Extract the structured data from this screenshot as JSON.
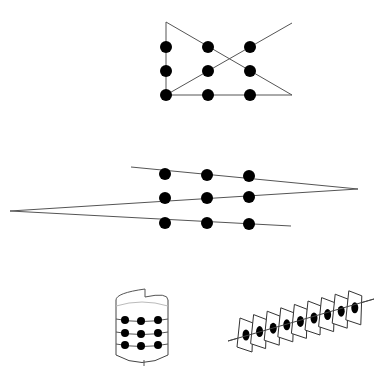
{
  "caption": "",
  "colors": {
    "dot": "#000000",
    "line": "#555555",
    "background": "#ffffff"
  },
  "figures": [
    {
      "id": "nine-dots-four-lines",
      "dot_radius": 6,
      "dots": [
        [
          166,
          47
        ],
        [
          208,
          47
        ],
        [
          250,
          47
        ],
        [
          166,
          71
        ],
        [
          208,
          71
        ],
        [
          250,
          71
        ],
        [
          166,
          95
        ],
        [
          208,
          95
        ],
        [
          250,
          95
        ]
      ],
      "polyline": [
        [
          292,
          23
        ],
        [
          166,
          95
        ],
        [
          166,
          22
        ],
        [
          292,
          95
        ],
        [
          166,
          95
        ]
      ]
    },
    {
      "id": "nine-dots-three-lines-zigzag",
      "dot_radius": 6,
      "dots": [
        [
          165,
          174
        ],
        [
          207,
          175
        ],
        [
          249,
          176
        ],
        [
          165,
          198
        ],
        [
          207,
          198
        ],
        [
          249,
          197
        ],
        [
          165,
          223
        ],
        [
          207,
          223
        ],
        [
          249,
          224
        ]
      ],
      "polyline": [
        [
          131,
          167
        ],
        [
          358,
          189
        ],
        [
          10,
          211
        ],
        [
          291,
          226
        ]
      ]
    },
    {
      "id": "nine-dots-rolled-cylinder",
      "dot_radius": 4,
      "dots": [
        [
          125,
          320
        ],
        [
          141,
          321
        ],
        [
          158,
          320
        ],
        [
          125,
          333
        ],
        [
          141,
          334
        ],
        [
          158,
          333
        ],
        [
          125,
          345
        ],
        [
          141,
          346
        ],
        [
          158,
          345
        ]
      ],
      "rows_y": [
        320,
        333,
        345
      ],
      "left_x": 116,
      "right_x": 168
    },
    {
      "id": "nine-dots-folded-panels",
      "panel_count": 9,
      "first_center": [
        246,
        335
      ],
      "step": [
        13.6,
        -3.4
      ],
      "line": [
        [
          228,
          341
        ],
        [
          374,
          299
        ]
      ]
    }
  ]
}
